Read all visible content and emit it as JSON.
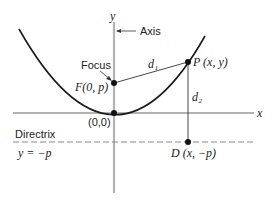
{
  "diagram": {
    "axes": {
      "x_label": "x",
      "y_label": "y",
      "axis_label": "Axis"
    },
    "points": {
      "focus_label": "Focus",
      "focus": "F(0, p)",
      "origin": "(0,0)",
      "point_p": "P (x, y)",
      "point_d": "D (x, −p)"
    },
    "distances": {
      "d1": "d₁",
      "d2": "d₂"
    },
    "directrix": {
      "label": "Directrix",
      "equation": "y = −p"
    },
    "colors": {
      "axis": "#b0b0b0",
      "curve": "#1a1a1a",
      "line": "#333333",
      "directrix": "#888888"
    }
  }
}
